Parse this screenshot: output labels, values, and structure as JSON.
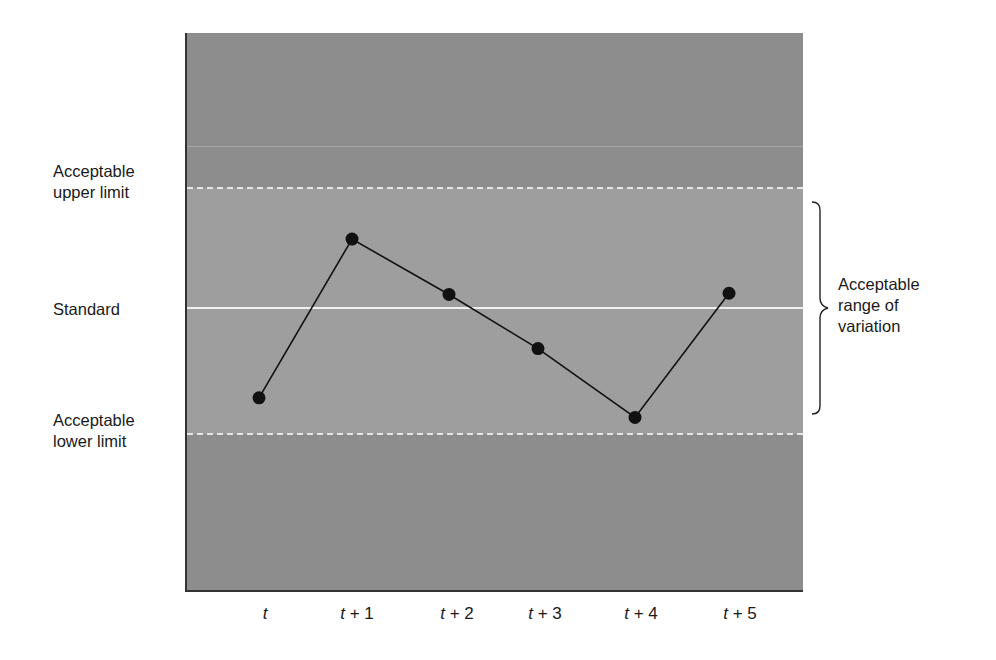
{
  "chart_data": {
    "type": "line",
    "title": "",
    "xlabel": "",
    "ylabel": "",
    "categories": [
      "t",
      "t + 1",
      "t + 2",
      "t + 3",
      "t + 4",
      "t + 5"
    ],
    "series": [
      {
        "name": "Measured performance",
        "values": [
          -0.73,
          0.56,
          0.11,
          -0.33,
          -0.89,
          0.12
        ]
      }
    ],
    "reference_lines": [
      {
        "name": "Acceptable upper limit",
        "value": 1,
        "style": "dashed"
      },
      {
        "name": "Standard",
        "value": 0,
        "style": "solid"
      },
      {
        "name": "Acceptable lower limit",
        "value": -1,
        "style": "dashed"
      }
    ],
    "annotations": [
      {
        "text": "Acceptable range of variation",
        "span": [
          -1,
          1
        ],
        "type": "brace"
      }
    ],
    "ylim": [
      -2.3,
      2.2
    ],
    "grid": false,
    "legend": "none"
  },
  "labels": {
    "upper_limit": [
      "Acceptable",
      "upper limit"
    ],
    "standard": "Standard",
    "lower_limit": [
      "Acceptable",
      "lower limit"
    ],
    "range": [
      "Acceptable",
      "range of",
      "variation"
    ]
  },
  "x_ticks": [
    {
      "var": "t",
      "suffix": ""
    },
    {
      "var": "t",
      "suffix": " + 1"
    },
    {
      "var": "t",
      "suffix": " + 2"
    },
    {
      "var": "t",
      "suffix": " + 3"
    },
    {
      "var": "t",
      "suffix": " + 4"
    },
    {
      "var": "t",
      "suffix": " + 5"
    }
  ],
  "colors": {
    "outer_band": "#8d8d8d",
    "acceptable_band": "#9e9e9e",
    "reference_line": "#f0f0f0",
    "series": "#111111"
  }
}
